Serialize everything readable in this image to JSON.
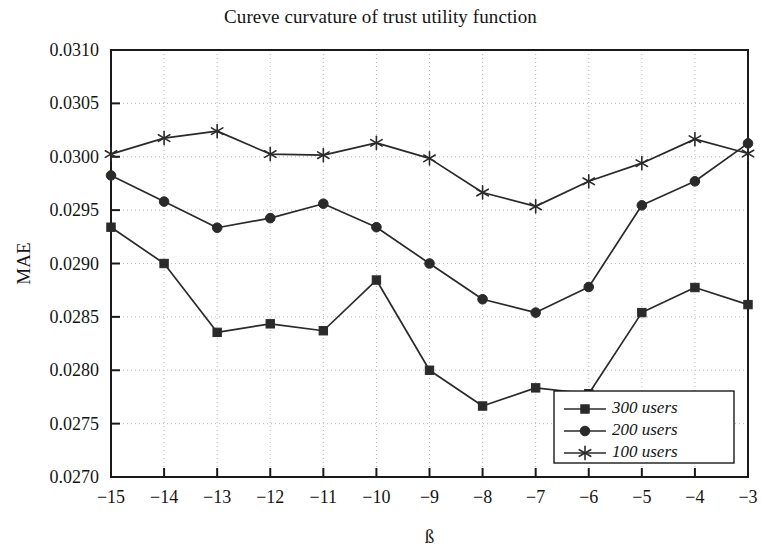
{
  "chart_data": {
    "type": "line",
    "title": "Cureve curvature of trust utility function",
    "xlabel": "ß",
    "ylabel": "MAE",
    "x": [
      -15,
      -14,
      -13,
      -12,
      -11,
      -10,
      -9,
      -8,
      -7,
      -6,
      -5,
      -4,
      -3
    ],
    "xtick_labels": [
      "−15",
      "−14",
      "−13",
      "−12",
      "−11",
      "−10",
      "−9",
      "−8",
      "−7",
      "−6",
      "−5",
      "−4",
      "−3"
    ],
    "ytick_labels": [
      "0.0270",
      "0.0275",
      "0.0280",
      "0.0285",
      "0.0290",
      "0.0295",
      "0.0300",
      "0.0305",
      "0.0310"
    ],
    "yticks": [
      0.027,
      0.0275,
      0.028,
      0.0285,
      0.029,
      0.0295,
      0.03,
      0.0305,
      0.031
    ],
    "xlim": [
      -15,
      -3
    ],
    "ylim": [
      0.027,
      0.031
    ],
    "grid": true,
    "legend_position": "bottom-right",
    "series": [
      {
        "name": "300 users",
        "marker": "square",
        "color": "#1a1a1a",
        "values": [
          0.02934,
          0.029,
          0.028355,
          0.028435,
          0.02837,
          0.028845,
          0.028,
          0.027665,
          0.027835,
          0.02778,
          0.02854,
          0.028775,
          0.028615
        ]
      },
      {
        "name": "200 users",
        "marker": "circle",
        "color": "#1a1a1a",
        "values": [
          0.029825,
          0.02958,
          0.029335,
          0.029425,
          0.02956,
          0.02934,
          0.029,
          0.028665,
          0.02854,
          0.02878,
          0.029545,
          0.02977,
          0.030125
        ]
      },
      {
        "name": "100 users",
        "marker": "asterisk",
        "color": "#1a1a1a",
        "values": [
          0.030025,
          0.030175,
          0.03024,
          0.030025,
          0.030015,
          0.03013,
          0.029985,
          0.029665,
          0.029535,
          0.02977,
          0.02994,
          0.030165,
          0.03003
        ]
      }
    ]
  },
  "legend": {
    "items": [
      {
        "label": "300 users",
        "marker": "square"
      },
      {
        "label": "200 users",
        "marker": "circle"
      },
      {
        "label": "100 users",
        "marker": "asterisk"
      }
    ]
  },
  "style": {
    "axis_color": "#1a1a1a",
    "grid_color": "#b9b9b9",
    "line_color": "#2a2a2a",
    "background": "#ffffff"
  }
}
